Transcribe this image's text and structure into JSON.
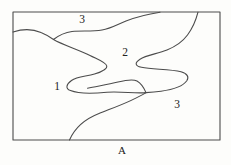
{
  "figure": {
    "regions": {
      "top_strip_label": "3",
      "center_label": "2",
      "left_label": "1",
      "bottom_right_label": "3"
    },
    "caption": "A",
    "colors": {
      "background": "#fdfdfb",
      "line": "#4c4c4c",
      "text": "#222222"
    }
  }
}
